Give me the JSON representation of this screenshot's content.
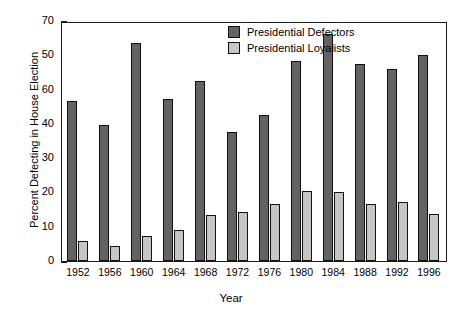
{
  "chart_data": {
    "type": "bar",
    "title": "",
    "xlabel": "Year",
    "ylabel": "Percent Defecting in House Election",
    "categories": [
      "1952",
      "1956",
      "1960",
      "1964",
      "1968",
      "1972",
      "1976",
      "1980",
      "1984",
      "1988",
      "1992",
      "1996"
    ],
    "ylim": [
      0,
      70
    ],
    "ytick_labels": [
      "70",
      "50",
      "60",
      "40",
      "30",
      "20",
      "10",
      "0"
    ],
    "ytick_values": [
      70,
      60,
      50,
      40,
      30,
      20,
      10,
      0
    ],
    "ytick_note": "Printed labels read 70, 50, 60, 40, 30, 20, 10, 0 — the 50 and 60 appear transposed in the original figure; tick spacing is uniform at 10-unit intervals.",
    "grid": false,
    "legend_position": "top-center-right",
    "series": [
      {
        "name": "Presidential Defectors",
        "color": "#636363",
        "values": [
          46.8,
          39.6,
          63.5,
          47.3,
          52.4,
          37.6,
          42.7,
          58.3,
          66.2,
          57.4,
          55.9,
          60.0
        ]
      },
      {
        "name": "Presidential Loyalists",
        "color": "#c6c6c6",
        "values": [
          5.8,
          4.5,
          7.3,
          9.1,
          13.4,
          14.2,
          16.6,
          20.4,
          20.0,
          16.5,
          17.2,
          13.8
        ]
      }
    ]
  },
  "legend": {
    "items": [
      {
        "label": "Presidential Defectors"
      },
      {
        "label": "Presidential Loyalists"
      }
    ]
  }
}
